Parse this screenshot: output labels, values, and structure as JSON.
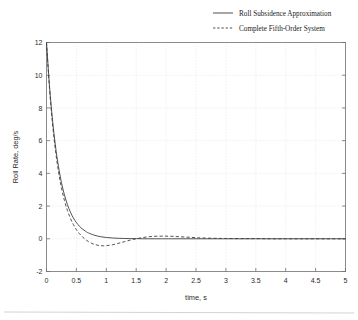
{
  "chart_data": {
    "type": "line",
    "title": "",
    "xlabel": "time, s",
    "ylabel": "Roll Rate, deg/s",
    "xlim": [
      0,
      5
    ],
    "ylim": [
      -2,
      12
    ],
    "grid": true,
    "legend_position": "top-right-outside",
    "xticks": [
      "0",
      "0.5",
      "1",
      "1.5",
      "2",
      "2.5",
      "3",
      "3.5",
      "4",
      "4.5",
      "5"
    ],
    "xtick_values": [
      0,
      0.5,
      1,
      1.5,
      2,
      2.5,
      3,
      3.5,
      4,
      4.5,
      5
    ],
    "yticks": [
      "-2",
      "0",
      "2",
      "4",
      "6",
      "8",
      "10",
      "12"
    ],
    "ytick_values": [
      -2,
      0,
      2,
      4,
      6,
      8,
      10,
      12
    ],
    "series": [
      {
        "name": "Roll Subsidence Approximation",
        "style": "solid",
        "color": "#3d3d3d",
        "x": [
          0,
          0.05,
          0.1,
          0.15,
          0.2,
          0.25,
          0.3,
          0.35,
          0.4,
          0.45,
          0.5,
          0.55,
          0.6,
          0.65,
          0.7,
          0.8,
          0.9,
          1.0,
          1.1,
          1.2,
          1.3,
          1.4,
          1.5,
          1.6,
          1.7,
          1.8,
          1.9,
          2.0,
          2.2,
          2.4,
          2.6,
          2.8,
          3.0,
          3.25,
          3.5,
          3.75,
          4.0,
          4.25,
          4.5,
          4.75,
          5.0
        ],
        "y": [
          12.0,
          9.35,
          7.28,
          5.67,
          4.42,
          3.44,
          2.68,
          2.09,
          1.63,
          1.27,
          0.99,
          0.77,
          0.6,
          0.47,
          0.36,
          0.22,
          0.13,
          0.08,
          0.05,
          0.03,
          0.02,
          0.01,
          0.01,
          0.0,
          0.0,
          0.0,
          0.0,
          0.0,
          0.0,
          0.0,
          0.0,
          0.0,
          0.0,
          0.0,
          0.0,
          0.0,
          0.0,
          0.0,
          0.0,
          0.0,
          0.0
        ]
      },
      {
        "name": "Complete Fifth-Order System",
        "style": "dashed",
        "color": "#3d3d3d",
        "x": [
          0,
          0.05,
          0.1,
          0.15,
          0.2,
          0.25,
          0.3,
          0.35,
          0.4,
          0.45,
          0.5,
          0.55,
          0.6,
          0.65,
          0.7,
          0.75,
          0.8,
          0.85,
          0.9,
          0.95,
          1.0,
          1.1,
          1.2,
          1.3,
          1.4,
          1.5,
          1.6,
          1.7,
          1.8,
          1.9,
          2.0,
          2.1,
          2.2,
          2.3,
          2.4,
          2.5,
          2.6,
          2.8,
          3.0,
          3.25,
          3.5,
          3.75,
          4.0,
          4.25,
          4.5,
          4.75,
          5.0
        ],
        "y": [
          12.0,
          9.2,
          7.05,
          5.4,
          4.12,
          3.12,
          2.34,
          1.73,
          1.25,
          0.87,
          0.56,
          0.32,
          0.12,
          -0.04,
          -0.17,
          -0.27,
          -0.34,
          -0.39,
          -0.42,
          -0.43,
          -0.42,
          -0.37,
          -0.28,
          -0.18,
          -0.08,
          0.0,
          0.07,
          0.12,
          0.15,
          0.16,
          0.16,
          0.15,
          0.13,
          0.11,
          0.09,
          0.07,
          0.05,
          0.03,
          0.02,
          0.01,
          0.01,
          0.0,
          0.0,
          0.0,
          0.0,
          0.0,
          0.0
        ]
      }
    ]
  },
  "legend": {
    "items": [
      {
        "label": "Roll Subsidence Approximation",
        "style": "solid"
      },
      {
        "label": "Complete Fifth-Order System",
        "style": "dashed"
      }
    ]
  },
  "axes": {
    "x_title": "time, s",
    "y_title": "Roll Rate, deg/s"
  }
}
